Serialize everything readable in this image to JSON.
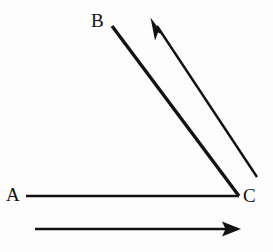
{
  "figure": {
    "background_color": "#fdfdfd",
    "stroke_color": "#121212",
    "width": 273,
    "height": 252,
    "labels": [
      {
        "id": "A",
        "text": "A",
        "x": 14,
        "y": 195
      },
      {
        "id": "B",
        "text": "B",
        "x": 98,
        "y": 20
      },
      {
        "id": "C",
        "text": "C",
        "x": 250,
        "y": 196
      }
    ],
    "segments": [
      {
        "name": "segment-AC",
        "from": "A",
        "to": "C",
        "x1": 26,
        "y1": 196,
        "x2": 239,
        "y2": 196,
        "stroke_width": 2.6,
        "arrow": "none"
      },
      {
        "name": "segment-CB",
        "from": "C",
        "to": "B",
        "x1": 239,
        "y1": 196,
        "x2": 112,
        "y2": 26,
        "stroke_width": 3.4,
        "arrow": "none"
      }
    ],
    "arrows": [
      {
        "name": "arrow-parallel-to-CB",
        "x1": 257,
        "y1": 177,
        "x2": 155,
        "y2": 23,
        "stroke_width": 2.4,
        "arrow": "end",
        "direction": "up-left"
      },
      {
        "name": "arrow-parallel-to-AC",
        "x1": 35,
        "y1": 229,
        "x2": 237,
        "y2": 229,
        "stroke_width": 2.6,
        "arrow": "end",
        "direction": "right"
      }
    ]
  }
}
